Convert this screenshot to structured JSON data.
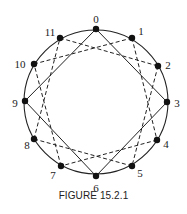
{
  "figure": {
    "caption": "FIGURE 15.2.1",
    "circle": {
      "cx": 96,
      "cy": 102,
      "r": 72
    },
    "nodes": [
      {
        "label": "0",
        "x": 96,
        "y": 29,
        "lx": 96,
        "ly": 20
      },
      {
        "label": "1",
        "x": 132,
        "y": 38,
        "lx": 141,
        "ly": 32
      },
      {
        "label": "2",
        "x": 158,
        "y": 66,
        "lx": 168,
        "ly": 66
      },
      {
        "label": "3",
        "x": 167,
        "y": 102,
        "lx": 177,
        "ly": 104
      },
      {
        "label": "4",
        "x": 157,
        "y": 140,
        "lx": 166,
        "ly": 145
      },
      {
        "label": "5",
        "x": 132,
        "y": 166,
        "lx": 140,
        "ly": 174
      },
      {
        "label": "6",
        "x": 96,
        "y": 176,
        "lx": 96,
        "ly": 189
      },
      {
        "label": "7",
        "x": 61,
        "y": 166,
        "lx": 53,
        "ly": 176
      },
      {
        "label": "8",
        "x": 34,
        "y": 139,
        "lx": 27,
        "ly": 146
      },
      {
        "label": "9",
        "x": 25,
        "y": 101,
        "lx": 15,
        "ly": 104
      },
      {
        "label": "10",
        "x": 34,
        "y": 64,
        "lx": 20,
        "ly": 65
      },
      {
        "label": "11",
        "x": 60,
        "y": 38,
        "lx": 50,
        "ly": 33
      }
    ],
    "solid_edges": [
      [
        0,
        3
      ],
      [
        3,
        6
      ],
      [
        6,
        9
      ],
      [
        9,
        0
      ]
    ],
    "dashed_edges": [
      [
        1,
        4
      ],
      [
        4,
        7
      ],
      [
        7,
        10
      ],
      [
        10,
        1
      ],
      [
        2,
        5
      ],
      [
        5,
        8
      ],
      [
        8,
        11
      ],
      [
        11,
        2
      ]
    ]
  }
}
